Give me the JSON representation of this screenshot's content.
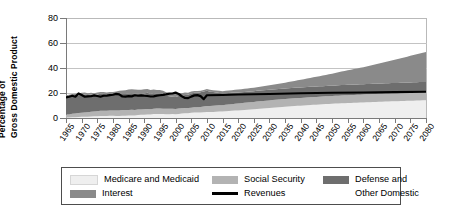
{
  "chart_data": {
    "type": "area",
    "title": "",
    "xlabel": "",
    "ylabel_line1": "Percentage of",
    "ylabel_line2": "Gross Domestic Product",
    "ylim": [
      0,
      80
    ],
    "yticks": [
      0,
      20,
      40,
      60,
      80
    ],
    "xlim": [
      1965,
      2080
    ],
    "grid": true,
    "legend_position": "bottom",
    "stacked": true,
    "categories": [
      1965,
      1970,
      1975,
      1980,
      1985,
      1990,
      1995,
      2000,
      2005,
      2010,
      2015,
      2020,
      2025,
      2030,
      2035,
      2040,
      2045,
      2050,
      2055,
      2060,
      2065,
      2070,
      2075,
      2080
    ],
    "series": [
      {
        "name": "Medicare and Medicaid",
        "color": "#efefef",
        "values": [
          0.4,
          1.0,
          1.4,
          1.7,
          2.0,
          2.6,
          3.2,
          3.2,
          4.0,
          4.6,
          5.3,
          6.1,
          7.0,
          8.0,
          9.0,
          9.9,
          10.7,
          11.4,
          12.0,
          12.5,
          13.0,
          13.4,
          13.8,
          14.2
        ]
      },
      {
        "name": "Social Security",
        "color": "#b3b3b3",
        "values": [
          2.5,
          3.1,
          4.1,
          4.3,
          4.4,
          4.3,
          4.5,
          4.1,
          4.2,
          4.8,
          5.0,
          5.5,
          5.9,
          6.1,
          6.2,
          6.2,
          6.2,
          6.2,
          6.3,
          6.3,
          6.4,
          6.4,
          6.5,
          6.5
        ]
      },
      {
        "name": "Defense and Other Domestic",
        "color": "#6e6e6e",
        "values": [
          14.2,
          14.7,
          13.3,
          13.0,
          13.5,
          12.7,
          11.3,
          9.8,
          11.2,
          12.0,
          9.4,
          8.9,
          8.6,
          8.5,
          8.4,
          8.4,
          8.3,
          8.3,
          8.3,
          8.2,
          8.2,
          8.2,
          8.2,
          8.2
        ]
      },
      {
        "name": "Interest",
        "color": "#8a8a8a",
        "values": [
          1.2,
          1.4,
          1.5,
          1.9,
          3.1,
          3.2,
          3.2,
          2.3,
          1.5,
          1.4,
          1.8,
          2.3,
          2.8,
          3.6,
          4.7,
          6.1,
          7.8,
          9.6,
          11.6,
          13.7,
          16.0,
          18.5,
          21.2,
          24.0
        ]
      }
    ],
    "line_series": {
      "name": "Revenues",
      "color": "#000000",
      "x": [
        1965,
        1966,
        1967,
        1968,
        1969,
        1970,
        1971,
        1972,
        1973,
        1974,
        1975,
        1976,
        1977,
        1978,
        1979,
        1980,
        1981,
        1982,
        1983,
        1984,
        1985,
        1986,
        1987,
        1988,
        1989,
        1990,
        1991,
        1992,
        1993,
        1994,
        1995,
        1996,
        1997,
        1998,
        1999,
        2000,
        2001,
        2002,
        2003,
        2004,
        2005,
        2006,
        2007,
        2008,
        2009,
        2010,
        2015,
        2020,
        2030,
        2040,
        2050,
        2060,
        2070,
        2080
      ],
      "values": [
        16.4,
        17.0,
        17.8,
        17.0,
        19.7,
        18.4,
        17.0,
        17.3,
        17.4,
        18.1,
        17.6,
        17.0,
        17.8,
        17.9,
        18.3,
        18.6,
        19.3,
        18.9,
        17.2,
        17.1,
        17.5,
        17.3,
        18.2,
        17.8,
        18.1,
        17.8,
        17.6,
        17.2,
        17.3,
        17.9,
        18.2,
        18.5,
        18.9,
        19.5,
        19.6,
        20.3,
        19.2,
        17.4,
        16.0,
        15.9,
        17.1,
        18.1,
        18.3,
        17.5,
        15.1,
        18.2,
        18.4,
        18.8,
        19.2,
        19.8,
        20.2,
        20.4,
        20.7,
        21.0
      ]
    },
    "legend": [
      {
        "label": "Medicare and Medicaid",
        "type": "swatch",
        "color": "#efefef"
      },
      {
        "label": "Social Security",
        "type": "swatch",
        "color": "#b3b3b3"
      },
      {
        "label": "Defense and",
        "label2": "Other Domestic",
        "type": "swatch",
        "color": "#6e6e6e"
      },
      {
        "label": "Interest",
        "type": "swatch",
        "color": "#8a8a8a"
      },
      {
        "label": "Revenues",
        "type": "line",
        "color": "#000000"
      }
    ]
  }
}
